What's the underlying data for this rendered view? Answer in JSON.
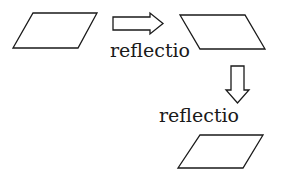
{
  "diagram": {
    "shapes": [
      {
        "name": "original-parallelogram",
        "points": "33,13 97,13 78,48 13,48"
      },
      {
        "name": "reflected-parallelogram",
        "points": "180,15 245,15 265,49 200,49"
      },
      {
        "name": "twice-reflected-parallelogram",
        "points": "200,135 263,135 243,168 178,168"
      }
    ],
    "arrows": [
      {
        "name": "right-arrow",
        "points": "113,17 150,17 150,13 163,23.5 150,34 150,30 113,30"
      },
      {
        "name": "down-arrow",
        "points": "231,66 244,66 244,90 249,90 237.5,103 226,90 231,90"
      }
    ],
    "labels": {
      "first": "reflectio",
      "second": "reflectio"
    },
    "stroke_color": "#1a1a1a"
  }
}
